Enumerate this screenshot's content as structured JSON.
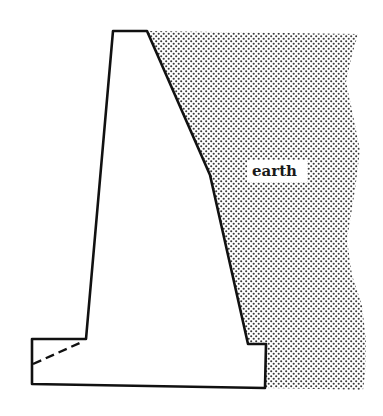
{
  "diagram": {
    "type": "retaining-wall-cross-section",
    "labels": {
      "earth": "earth"
    },
    "colors": {
      "outline": "#111111",
      "background": "#ffffff",
      "soil_dots": "#333333",
      "label_bg": "#ffffff"
    },
    "elements": [
      {
        "name": "retaining-wall",
        "description": "Trapezoidal cantilever/gravity wall with toe and heel base"
      },
      {
        "name": "earth-backfill",
        "description": "Stippled soil region retained behind the wall"
      },
      {
        "name": "dashed-line",
        "description": "Dashed line across the toe of the base slab"
      }
    ]
  }
}
